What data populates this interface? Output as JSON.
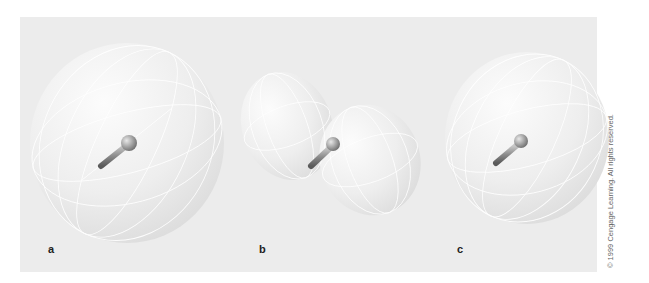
{
  "figure": {
    "panels": [
      {
        "id": "a",
        "label": "a",
        "description": "Omnidirectional (spherical) radiation pattern around a speaker"
      },
      {
        "id": "b",
        "label": "b",
        "description": "Dipole (figure-eight) radiation pattern, two lobes"
      },
      {
        "id": "c",
        "label": "c",
        "description": "Cardioid / directional radiation pattern"
      }
    ],
    "copyright": "© 1999 Cengage Learning. All rights reserved."
  },
  "colors": {
    "background": "#ececec",
    "sphere_fill": "#f4f4f4",
    "grid_lines": "#ffffff",
    "rod": "#8a8a8a"
  }
}
